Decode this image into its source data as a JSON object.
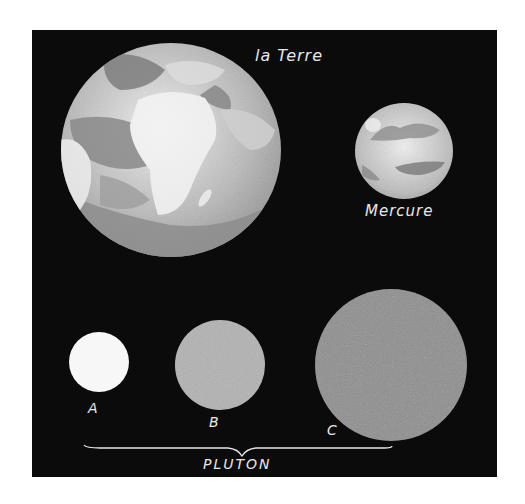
{
  "figure": {
    "background": "#0b0b0b",
    "bodies": [
      {
        "id": "earth",
        "label": "la Terre",
        "color": "#c8c8c8"
      },
      {
        "id": "mercury",
        "label": "Mercure",
        "color": "#c4c4c4"
      },
      {
        "id": "pluto_a",
        "label": "A",
        "color": "#f7f7f7"
      },
      {
        "id": "pluto_b",
        "label": "B",
        "color": "#b0b0b0"
      },
      {
        "id": "pluto_c",
        "label": "C",
        "color": "#8c8c8c"
      }
    ],
    "group_label": "PLUTON"
  }
}
